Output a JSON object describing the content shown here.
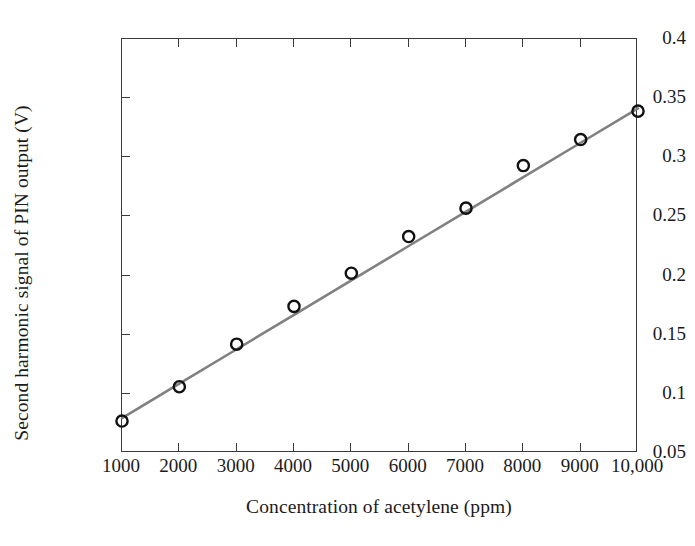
{
  "chart_data": {
    "type": "scatter",
    "title": "",
    "xlabel": "Concentration of acetylene (ppm)",
    "ylabel": "Second harmonic signal of PIN output (V)",
    "x": [
      1000,
      2000,
      3000,
      4000,
      5000,
      6000,
      7000,
      8000,
      9000,
      10000
    ],
    "values": [
      0.077,
      0.106,
      0.142,
      0.174,
      0.202,
      0.233,
      0.257,
      0.293,
      0.315,
      0.339
    ],
    "series": [
      {
        "name": "Measured second harmonic signal",
        "marker": "open-circle",
        "marker_color": "#111111",
        "values": [
          0.077,
          0.106,
          0.142,
          0.174,
          0.202,
          0.233,
          0.257,
          0.293,
          0.315,
          0.339
        ]
      },
      {
        "name": "Linear fit",
        "marker": "none",
        "line_color": "#808080",
        "values": [
          0.0795,
          0.1086,
          0.1377,
          0.1668,
          0.1959,
          0.225,
          0.2541,
          0.2832,
          0.3123,
          0.3414
        ]
      }
    ],
    "xlim": [
      1000,
      10000
    ],
    "ylim": [
      0.05,
      0.4
    ],
    "xticks": [
      1000,
      2000,
      3000,
      4000,
      5000,
      6000,
      7000,
      8000,
      9000,
      10000
    ],
    "xtick_labels": [
      "1000",
      "2000",
      "3000",
      "4000",
      "5000",
      "6000",
      "7000",
      "8000",
      "9000",
      "10,000"
    ],
    "yticks": [
      0.05,
      0.1,
      0.15,
      0.2,
      0.25,
      0.3,
      0.35,
      0.4
    ],
    "ytick_labels": [
      "0.05",
      "0.1",
      "0.15",
      "0.2",
      "0.25",
      "0.3",
      "0.35",
      "0.4"
    ],
    "grid": false,
    "legend": "none",
    "frame": "box",
    "annotations": []
  },
  "colors": {
    "axis": "#3a3a3a",
    "line": "#808080",
    "marker": "#111111",
    "text": "#1b1b1b",
    "background": "#ffffff"
  }
}
